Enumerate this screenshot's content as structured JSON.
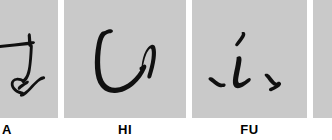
{
  "figure": {
    "kind": "handwriting-sample-strip",
    "background_color": "#ffffff",
    "panel_color": "#c9c9c9",
    "ink_color": "#101010",
    "panel_count_visible": 4,
    "panels": [
      {
        "id": "a",
        "caption": "A",
        "character": "あ",
        "romaji": "A",
        "script": "hiragana",
        "clipped": true,
        "clipped_side": "left"
      },
      {
        "id": "hi",
        "caption": "HI",
        "character": "ひ",
        "romaji": "HI",
        "script": "hiragana",
        "clipped": false,
        "clipped_side": "none"
      },
      {
        "id": "fu",
        "caption": "FU",
        "character": "ふ",
        "romaji": "FU",
        "script": "hiragana",
        "clipped": false,
        "clipped_side": "none"
      },
      {
        "id": "next",
        "caption": "",
        "character": "",
        "romaji": "",
        "script": "hiragana",
        "clipped": true,
        "clipped_side": "right"
      }
    ]
  }
}
